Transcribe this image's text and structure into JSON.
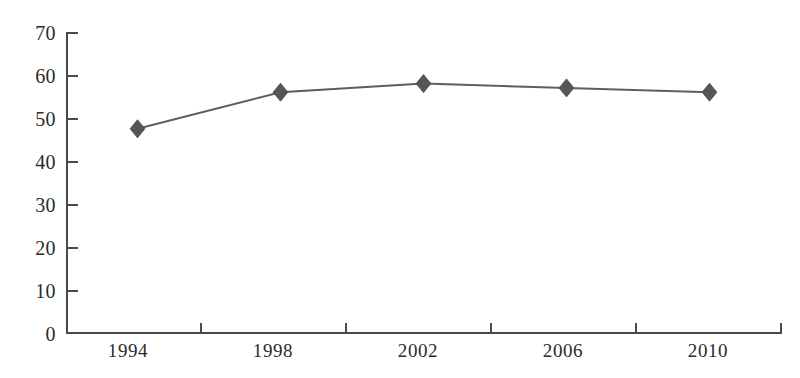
{
  "chart_data": {
    "type": "line",
    "title": "",
    "subtitle": "",
    "xlabel": "",
    "ylabel": "",
    "categories": [
      "1994",
      "1998",
      "2002",
      "2006",
      "2010"
    ],
    "values": [
      47.5,
      56,
      58,
      57,
      56
    ],
    "series": [
      {
        "name": "",
        "values": [
          47.5,
          56,
          58,
          57,
          56
        ],
        "marker": "diamond",
        "line_color": "#5e5e5e",
        "marker_color": "#565656"
      }
    ],
    "ylim": [
      0,
      70
    ],
    "y_ticks": [
      0,
      10,
      20,
      30,
      40,
      50,
      60,
      70
    ],
    "y_tick_labels": [
      "0",
      "10",
      "20",
      "30",
      "40",
      "50",
      "60",
      "70"
    ],
    "x_tick_labels": [
      "1994",
      "1998",
      "2002",
      "2006",
      "2010"
    ],
    "grid": false,
    "legend": false,
    "legend_position": "none",
    "axis_color": "#4a4a4a",
    "background_color": "#ffffff"
  },
  "axes": {
    "y_labels": [
      "70",
      "60",
      "50",
      "40",
      "30",
      "20",
      "10",
      "0"
    ],
    "x_labels": [
      "1994",
      "1998",
      "2002",
      "2006",
      "2010"
    ]
  }
}
